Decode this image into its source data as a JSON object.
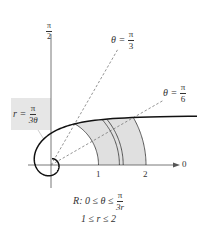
{
  "figure": {
    "axis_labels": {
      "polar_axis": "0",
      "vertical_axis_num": "π",
      "vertical_axis_den": "2"
    },
    "ticks": [
      "1",
      "2"
    ],
    "rays": [
      {
        "label_lhs": "θ =",
        "num": "π",
        "den": "3",
        "angle": "π/3"
      },
      {
        "label_lhs": "θ =",
        "num": "π",
        "den": "6",
        "angle": "π/6"
      }
    ],
    "curve_label": {
      "lhs": "r =",
      "num": "π",
      "den": "3θ"
    },
    "caption": {
      "line1_prefix": "R: 0 ≤ θ ≤",
      "line1_num": "π",
      "line1_den": "3r",
      "line2": "1 ≤ r ≤ 2"
    },
    "colors": {
      "region_fill": "#e0e0e0",
      "curve": "#111111",
      "dashed": "#777777",
      "axis": "#555555",
      "label_box": "#e6e6e6"
    }
  }
}
